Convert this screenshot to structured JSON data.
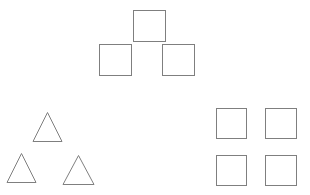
{
  "figure": {
    "canvas": {
      "width": 310,
      "height": 195
    },
    "background_color": "#ffffff",
    "stroke_color": "#7f7f7f",
    "stroke_width": 1,
    "fill": "none",
    "shape_counts": {
      "squares": 7,
      "triangles": 3,
      "total": 10
    },
    "groups": [
      {
        "id": "square-pyramid-top",
        "name": "Top square pyramid",
        "shape_type": "square",
        "count": 3,
        "layout": "pyramid"
      },
      {
        "id": "triangle-cluster-left",
        "name": "Lower-left triangle cluster",
        "shape_type": "triangle",
        "count": 3,
        "layout": "pyramid"
      },
      {
        "id": "square-grid-right",
        "name": "Lower-right square grid",
        "shape_type": "square",
        "count": 4,
        "layout": "2x2-grid"
      }
    ]
  },
  "shapes": [
    {
      "id": "square-top-apex",
      "group": "square-pyramid-top",
      "type": "square",
      "x": 133.5,
      "y": 10.5,
      "width": 32,
      "height": 31
    },
    {
      "id": "square-top-left",
      "group": "square-pyramid-top",
      "type": "square",
      "x": 99.5,
      "y": 44.5,
      "width": 32,
      "height": 31
    },
    {
      "id": "square-top-right",
      "group": "square-pyramid-top",
      "type": "square",
      "x": 162.5,
      "y": 44.5,
      "width": 32,
      "height": 31
    },
    {
      "id": "triangle-apex",
      "group": "triangle-cluster-left",
      "type": "triangle",
      "cx": 47.5,
      "base_y": 141.5,
      "apex_y": 112.5,
      "half_base": 14.5
    },
    {
      "id": "triangle-bottom-left",
      "group": "triangle-cluster-left",
      "type": "triangle",
      "cx": 21.5,
      "base_y": 182.5,
      "apex_y": 153.5,
      "half_base": 14.5
    },
    {
      "id": "triangle-bottom-right",
      "group": "triangle-cluster-left",
      "type": "triangle",
      "cx": 78.5,
      "base_y": 184.5,
      "apex_y": 155.5,
      "half_base": 15.5
    },
    {
      "id": "square-grid-top-left",
      "group": "square-grid-right",
      "type": "square",
      "x": 216.5,
      "y": 108.5,
      "width": 30,
      "height": 30
    },
    {
      "id": "square-grid-top-right",
      "group": "square-grid-right",
      "type": "square",
      "x": 265.5,
      "y": 108.5,
      "width": 31,
      "height": 30
    },
    {
      "id": "square-grid-bottom-left",
      "group": "square-grid-right",
      "type": "square",
      "x": 216.5,
      "y": 155.5,
      "width": 30,
      "height": 30
    },
    {
      "id": "square-grid-bottom-right",
      "group": "square-grid-right",
      "type": "square",
      "x": 265.5,
      "y": 155.5,
      "width": 31,
      "height": 30
    }
  ]
}
